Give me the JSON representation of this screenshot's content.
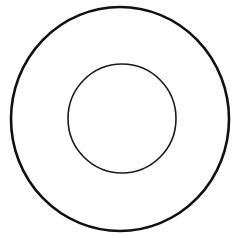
{
  "diagram": {
    "type": "concentric-circles",
    "background": "#ffffff",
    "shapes": [
      {
        "name": "outer-circle",
        "cx": 120,
        "cy": 119,
        "rx": 109,
        "ry": 112,
        "stroke": "#111111",
        "stroke_width": 2.6,
        "fill": "none"
      },
      {
        "name": "inner-circle",
        "cx": 122,
        "cy": 118.5,
        "rx": 54,
        "ry": 54.5,
        "stroke": "#1a1a1a",
        "stroke_width": 1.6,
        "fill": "none"
      }
    ]
  }
}
